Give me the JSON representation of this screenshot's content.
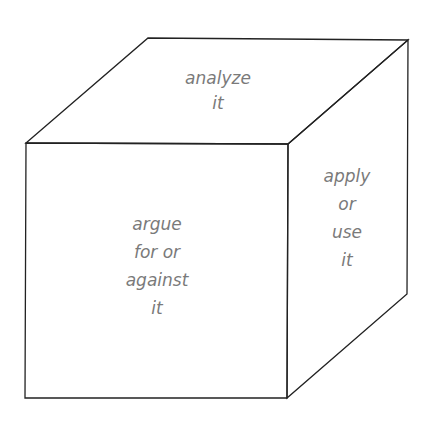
{
  "diagram": {
    "type": "cube",
    "faces": {
      "top": {
        "lines": [
          "analyze",
          "it"
        ]
      },
      "front": {
        "lines": [
          "argue",
          "for or",
          "against",
          "it"
        ]
      },
      "right": {
        "lines": [
          "apply",
          "or",
          "use",
          "it"
        ]
      }
    },
    "colors": {
      "stroke": "#222222",
      "text": "#7a7a7a",
      "background": "#ffffff"
    }
  }
}
